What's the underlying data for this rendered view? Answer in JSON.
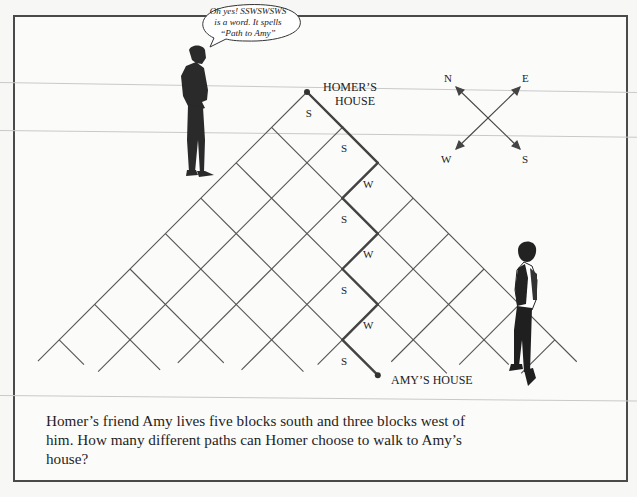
{
  "speech_bubble": {
    "speaker": "Homer",
    "lines": [
      "Oh yes! SSWSWSWS",
      "is a word. It spells",
      "“Path to Amy”"
    ]
  },
  "labels": {
    "homer_house_line1": "HOMER’S",
    "homer_house_line2": "HOUSE",
    "amy_house": "AMY’S HOUSE"
  },
  "compass": {
    "north": "N",
    "east": "E",
    "west": "W",
    "south": "S"
  },
  "path": {
    "word": "SSWSWSWS",
    "steps": [
      "S",
      "S",
      "W",
      "S",
      "W",
      "S",
      "W",
      "S"
    ]
  },
  "grid": {
    "size": 7,
    "origin": [
      307,
      92
    ],
    "step": 35.4
  },
  "problem_text": "Homer’s friend Amy lives five blocks south and three blocks west of him. How many different paths can Homer choose to walk to Amy’s house?",
  "colors": {
    "ink": "#222222",
    "grid": "#555555",
    "path": "#444444",
    "frame": "#4a4a4a"
  }
}
